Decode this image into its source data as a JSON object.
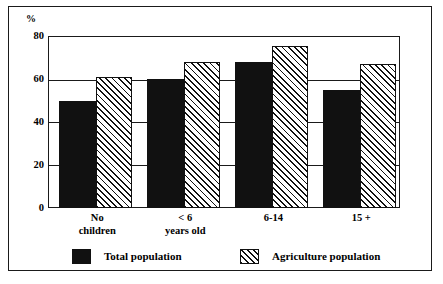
{
  "chart_data": {
    "type": "bar",
    "title": "",
    "subtitle": "",
    "xlabel": "",
    "ylabel": "",
    "unit_label": "%",
    "categories": [
      "No children",
      "< 6 years old",
      "6-14",
      "15 +"
    ],
    "category_lines": [
      [
        "No",
        "children"
      ],
      [
        "< 6",
        "years old"
      ],
      [
        "6-14"
      ],
      [
        "15 +"
      ]
    ],
    "series": [
      {
        "name": "Total population",
        "fill": "solid",
        "color": "#111111",
        "values": [
          50,
          60,
          68,
          55
        ]
      },
      {
        "name": "Agriculture population",
        "fill": "hatched",
        "color": "#111111",
        "values": [
          61,
          68,
          75.5,
          67
        ]
      }
    ],
    "ylim": [
      0,
      80
    ],
    "yticks": [
      0,
      20,
      40,
      60,
      80
    ],
    "ytick_labels": [
      "0",
      "20",
      "40",
      "60",
      "80"
    ],
    "grid": true,
    "grid_axis": "y",
    "legend_position": "bottom"
  },
  "legend": {
    "entries": [
      {
        "label": "Total population",
        "fill": "solid"
      },
      {
        "label": "Agriculture population",
        "fill": "hatched"
      }
    ]
  },
  "colors": {
    "frame": "#1a1a1a",
    "background": "#ffffff",
    "bar_solid": "#111111",
    "bar_hatch": "#111111"
  }
}
